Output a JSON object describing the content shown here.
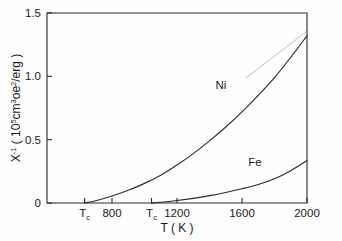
{
  "figure": {
    "background_color": "#fefefe",
    "ink_color": "#2a2a2a"
  },
  "chart_data": {
    "type": "line",
    "title": "",
    "subtitle": "",
    "xlabel": "T  ( K )",
    "ylabel": "X⁻¹ ( 10⁵cm³oe²/erg )",
    "ylabel_parts": {
      "symbol": "X",
      "exponent": "-1",
      "units_open": "( 10",
      "units_exp": "5",
      "units_mid": "cm",
      "units_exp2": "3",
      "units_mid2": "oe",
      "units_exp3": "2",
      "units_close": "/erg )"
    },
    "xlim": [
      400,
      2000
    ],
    "ylim": [
      0,
      1.5
    ],
    "grid": false,
    "legend": "inline-curve-labels",
    "xticks": [
      800,
      1200,
      1600,
      2000
    ],
    "xticklabels": [
      "800",
      "1200",
      "1600",
      "2000"
    ],
    "yticks": [
      0,
      0.5,
      1.0,
      1.5
    ],
    "yticklabels": [
      "0",
      "0.5",
      "1.0",
      "1.5"
    ],
    "special_xticks": [
      {
        "label": "Tc",
        "label_base": "T",
        "label_sub": "c",
        "value": 631,
        "series": "Ni"
      },
      {
        "label": "Tc",
        "label_base": "T",
        "label_sub": "c",
        "value": 1043,
        "series": "Fe"
      }
    ],
    "series": [
      {
        "name": "Ni",
        "label": "Ni",
        "label_x": 1470,
        "label_y": 0.9,
        "x": [
          631,
          700,
          800,
          900,
          1000,
          1100,
          1200,
          1300,
          1400,
          1500,
          1600,
          1700,
          1800,
          1900,
          2000
        ],
        "values": [
          0.0,
          0.018,
          0.055,
          0.1,
          0.155,
          0.22,
          0.3,
          0.39,
          0.49,
          0.6,
          0.72,
          0.85,
          0.99,
          1.15,
          1.32
        ]
      },
      {
        "name": "Fe",
        "label": "Fe",
        "label_x": 1680,
        "label_y": 0.295,
        "x": [
          1043,
          1100,
          1200,
          1300,
          1400,
          1500,
          1600,
          1700,
          1800,
          1900,
          2000
        ],
        "values": [
          0.0,
          0.006,
          0.02,
          0.037,
          0.058,
          0.083,
          0.112,
          0.146,
          0.192,
          0.255,
          0.335
        ]
      }
    ]
  }
}
